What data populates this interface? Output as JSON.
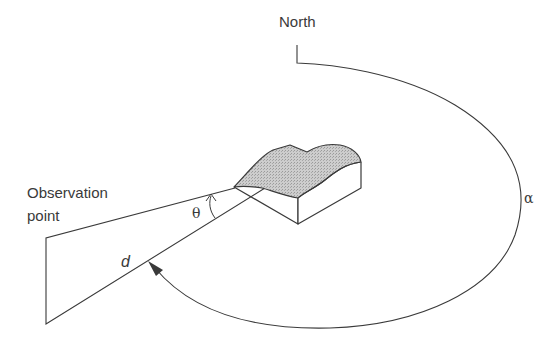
{
  "diagram": {
    "title": "",
    "labels": {
      "north": "North",
      "observation_line1": "Observation",
      "observation_line2": "point",
      "theta": "θ",
      "distance": "d",
      "alpha": "α"
    },
    "colors": {
      "stroke": "#3a3a3a",
      "terrain_fill": "#c4c4c4",
      "background": "#ffffff"
    }
  }
}
